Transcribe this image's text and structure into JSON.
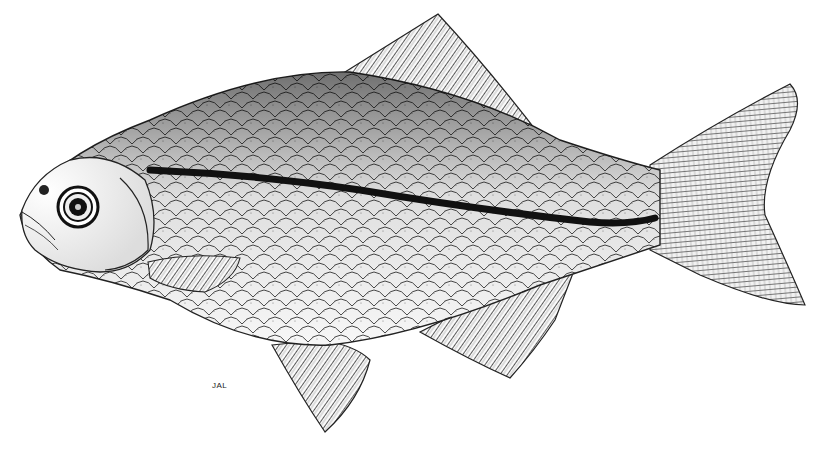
{
  "illustration": {
    "subject": "fish",
    "style": "stippled pen-and-ink scientific drawing",
    "signature": "JAL",
    "colors": {
      "background": "#ffffff",
      "ink": "#111111",
      "stipple_dark": "#1a1a1a",
      "scale_fill": "#f4f4f4"
    },
    "parts": [
      "head",
      "eye",
      "body-scales",
      "lateral-stripe",
      "dorsal-fin",
      "caudal-fin",
      "pectoral-fin",
      "pelvic-fin",
      "anal-fin"
    ]
  }
}
